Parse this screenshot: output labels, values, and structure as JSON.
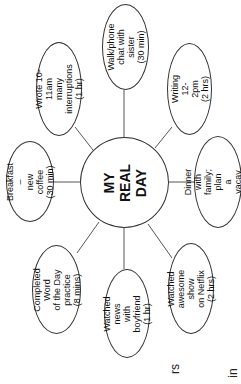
{
  "diagram": {
    "type": "mind-map",
    "orientation": "rotated -90deg",
    "center": {
      "label": "MY\nREAL DAY"
    },
    "nodes": [
      {
        "id": "walk",
        "label": "Walk/phone\nchat with sister\n(30 min)"
      },
      {
        "id": "writing",
        "label": "Writing\n12-2pm\n(2 hrs)"
      },
      {
        "id": "dinner",
        "label": "Dinner with\nfamily; plan\na vacay\n(2 hrs)"
      },
      {
        "id": "netflix",
        "label": "Watched\nawesome show\non Netflix\n(2 hrs)"
      },
      {
        "id": "news",
        "label": "Watched news\nwith boyfriend\n(1 hr)"
      },
      {
        "id": "word",
        "label": "Completed Word\nof the Day practice\n(8 mins)"
      },
      {
        "id": "breakfast",
        "label": "Breakfast –\nnew coffee\n(30 min)"
      },
      {
        "id": "wrote",
        "label": "Wrote 10-11am\nmany interruptions\n(1 hr)"
      }
    ],
    "fragments": [
      "rs",
      "in"
    ]
  }
}
